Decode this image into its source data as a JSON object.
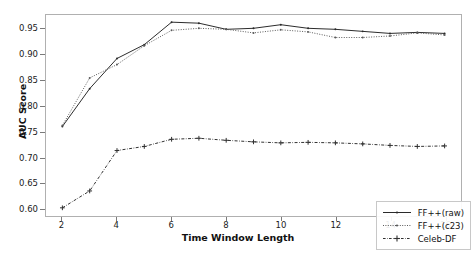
{
  "chart_data": {
    "type": "line",
    "title": "",
    "xlabel": "Time Window Length",
    "ylabel": "AUC Score",
    "x": [
      2,
      3,
      4,
      5,
      6,
      7,
      8,
      9,
      10,
      11,
      12,
      13,
      14,
      15,
      16
    ],
    "xlim": [
      1.4,
      16.6
    ],
    "ylim": [
      0.585,
      0.978
    ],
    "xticks": [
      2,
      4,
      6,
      8,
      10,
      12,
      14,
      16
    ],
    "xtick_labels": [
      "2",
      "4",
      "6",
      "8",
      "10",
      "12",
      "14",
      "16"
    ],
    "yticks": [
      0.6,
      0.65,
      0.7,
      0.75,
      0.8,
      0.85,
      0.9,
      0.95
    ],
    "ytick_labels": [
      "0.60",
      "0.65",
      "0.70",
      "0.75",
      "0.80",
      "0.85",
      "0.90",
      "0.95"
    ],
    "grid": false,
    "legend_position": "lower right",
    "series": [
      {
        "name": "FF++(raw)",
        "linestyle": "solid",
        "marker": "point",
        "color": "#2a2a2a",
        "values": [
          0.76,
          0.834,
          0.893,
          0.92,
          0.964,
          0.962,
          0.95,
          0.952,
          0.959,
          0.952,
          0.95,
          0.946,
          0.942,
          0.944,
          0.942
        ]
      },
      {
        "name": "FF++(c23)",
        "linestyle": "dotted",
        "marker": "point",
        "color": "#5a5a5a",
        "values": [
          0.762,
          0.855,
          0.881,
          0.918,
          0.948,
          0.952,
          0.95,
          0.943,
          0.949,
          0.945,
          0.934,
          0.934,
          0.937,
          0.943,
          0.939
        ]
      },
      {
        "name": "Celeb-DF",
        "linestyle": "dashdot",
        "marker": "plus",
        "color": "#303030",
        "values": [
          0.601,
          0.634,
          0.713,
          0.721,
          0.735,
          0.737,
          0.733,
          0.73,
          0.728,
          0.729,
          0.728,
          0.726,
          0.723,
          0.721,
          0.722
        ]
      }
    ]
  },
  "legend": {
    "items": [
      {
        "label": "FF++(raw)"
      },
      {
        "label": "FF++(c23)"
      },
      {
        "label": "Celeb-DF"
      }
    ]
  }
}
